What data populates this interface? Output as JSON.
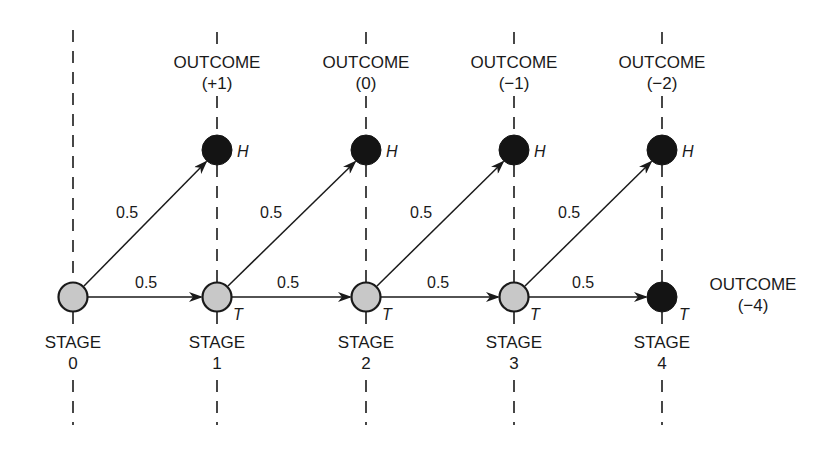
{
  "diagram": {
    "type": "probability-tree",
    "colors": {
      "line": "#1a1a1a",
      "intermediate_node_fill": "#c8c8c8",
      "terminal_node_fill": "#141414",
      "background": "#ffffff"
    },
    "stages": [
      {
        "label": "STAGE",
        "number": "0",
        "node_type": "intermediate",
        "node_tag": ""
      },
      {
        "label": "STAGE",
        "number": "1",
        "node_type": "intermediate",
        "node_tag": "T"
      },
      {
        "label": "STAGE",
        "number": "2",
        "node_type": "intermediate",
        "node_tag": "T"
      },
      {
        "label": "STAGE",
        "number": "3",
        "node_type": "intermediate",
        "node_tag": "T"
      },
      {
        "label": "STAGE",
        "number": "4",
        "node_type": "terminal",
        "node_tag": "T"
      }
    ],
    "head_outcomes": [
      {
        "label": "OUTCOME",
        "value": "(+1)",
        "node_tag": "H",
        "stage": 1
      },
      {
        "label": "OUTCOME",
        "value": "(0)",
        "node_tag": "H",
        "stage": 2
      },
      {
        "label": "OUTCOME",
        "value": "(−1)",
        "node_tag": "H",
        "stage": 3
      },
      {
        "label": "OUTCOME",
        "value": "(−2)",
        "node_tag": "H",
        "stage": 4
      }
    ],
    "final_outcome": {
      "label": "OUTCOME",
      "value": "(−4)",
      "node_tag": "T",
      "stage": 4
    },
    "edges": [
      {
        "from": "stage-0",
        "to": "H-1",
        "probability": "0.5"
      },
      {
        "from": "stage-0",
        "to": "stage-1",
        "probability": "0.5"
      },
      {
        "from": "stage-1",
        "to": "H-2",
        "probability": "0.5"
      },
      {
        "from": "stage-1",
        "to": "stage-2",
        "probability": "0.5"
      },
      {
        "from": "stage-2",
        "to": "H-3",
        "probability": "0.5"
      },
      {
        "from": "stage-2",
        "to": "stage-3",
        "probability": "0.5"
      },
      {
        "from": "stage-3",
        "to": "H-4",
        "probability": "0.5"
      },
      {
        "from": "stage-3",
        "to": "stage-4",
        "probability": "0.5"
      }
    ]
  }
}
